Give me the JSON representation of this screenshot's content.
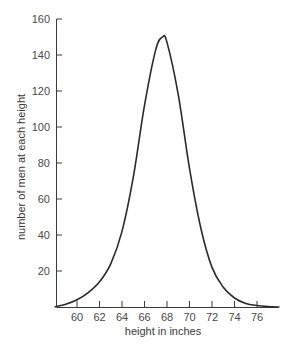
{
  "chart_data": {
    "type": "line",
    "title": "",
    "xlabel": "height in inches",
    "ylabel": "number of men at each height",
    "xlim": [
      58,
      78
    ],
    "ylim": [
      0,
      160
    ],
    "grid": false,
    "legend": null,
    "x_ticks": [
      60,
      62,
      64,
      66,
      68,
      70,
      72,
      74,
      76
    ],
    "y_ticks": [
      20,
      40,
      60,
      80,
      100,
      120,
      140,
      160
    ],
    "series": [
      {
        "name": "distribution of heights",
        "x": [
          58.0,
          59,
          60,
          61,
          62,
          63,
          64,
          65,
          66,
          67,
          67.6,
          68,
          69,
          70,
          71,
          72,
          73,
          74,
          75,
          76,
          77,
          78
        ],
        "y": [
          0,
          1.5,
          4,
          8,
          14,
          24,
          42,
          72,
          112,
          143,
          150,
          147,
          118,
          77,
          44,
          22,
          11,
          5,
          2,
          0.8,
          0.2,
          0
        ]
      }
    ],
    "color": "#2a2a2a"
  }
}
